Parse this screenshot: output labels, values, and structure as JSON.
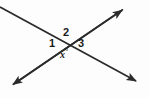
{
  "figure": {
    "kind": "geometry-diagram",
    "background_color": "#fdfdfd",
    "stroke_color": "#2b2b2b",
    "text_color": "#1a1a1a",
    "width": 149,
    "height": 98
  },
  "labels": {
    "angle_1": "1",
    "angle_2": "2",
    "angle_3": "3",
    "angle_x": "x",
    "degree_symbol": "°"
  },
  "geometry": {
    "intersection": {
      "x": 68,
      "y": 41
    },
    "lines": [
      {
        "name": "line-descending",
        "from": {
          "x": 0,
          "y": 7
        },
        "to": {
          "x": 139,
          "y": 83
        },
        "arrow_start": false,
        "arrow_end": true
      },
      {
        "name": "line-ascending",
        "from": {
          "x": 11,
          "y": 86
        },
        "to": {
          "x": 125,
          "y": 8
        },
        "arrow_start": true,
        "arrow_end": true
      }
    ],
    "label_positions": {
      "angle_2": {
        "x": 68,
        "y": 32
      },
      "angle_1": {
        "x": 53,
        "y": 43
      },
      "angle_3": {
        "x": 82,
        "y": 43
      },
      "angle_x": {
        "x": 65,
        "y": 52
      }
    }
  }
}
